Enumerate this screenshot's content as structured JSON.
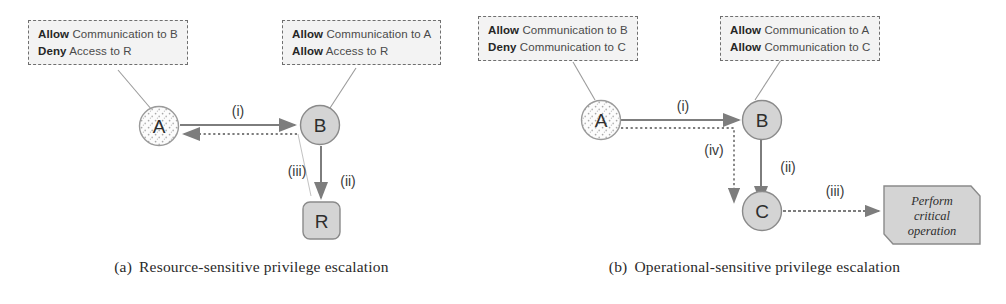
{
  "figure": {
    "panels": [
      {
        "id": "a",
        "caption_label": "(a)",
        "caption_text": "Resource-sensitive privilege escalation",
        "policy_boxes": [
          {
            "name": "policy-box-a-left",
            "lines": [
              {
                "keyword": "Allow",
                "rest": " Communication to B"
              },
              {
                "keyword": "Deny",
                "rest": " Access to R"
              }
            ]
          },
          {
            "name": "policy-box-a-right",
            "lines": [
              {
                "keyword": "Allow",
                "rest": " Communication to A"
              },
              {
                "keyword": "Allow",
                "rest": " Access to R"
              }
            ]
          }
        ],
        "nodes": [
          {
            "id": "A",
            "label": "A",
            "shape": "circle-dotted"
          },
          {
            "id": "B",
            "label": "B",
            "shape": "circle-solid"
          },
          {
            "id": "R",
            "label": "R",
            "shape": "rounded-square"
          }
        ],
        "edges": [
          {
            "id": "i",
            "label": "(i)",
            "from": "A",
            "to": "B",
            "style": "solid"
          },
          {
            "id": "ii",
            "label": "(ii)",
            "from": "B",
            "to": "R",
            "style": "solid"
          },
          {
            "id": "iii",
            "label": "(iii)",
            "from": "B",
            "to": "A",
            "style": "dotted"
          }
        ]
      },
      {
        "id": "b",
        "caption_label": "(b)",
        "caption_text": "Operational-sensitive privilege escalation",
        "policy_boxes": [
          {
            "name": "policy-box-b-left",
            "lines": [
              {
                "keyword": "Allow",
                "rest": " Communication to B"
              },
              {
                "keyword": "Deny",
                "rest": " Communication to C"
              }
            ]
          },
          {
            "name": "policy-box-b-right",
            "lines": [
              {
                "keyword": "Allow",
                "rest": " Communication to A"
              },
              {
                "keyword": "Allow",
                "rest": " Communication to C"
              }
            ]
          }
        ],
        "nodes": [
          {
            "id": "A",
            "label": "A",
            "shape": "circle-dotted"
          },
          {
            "id": "B",
            "label": "B",
            "shape": "circle-solid"
          },
          {
            "id": "C",
            "label": "C",
            "shape": "circle-solid"
          },
          {
            "id": "note",
            "label": "Perform critical operation",
            "shape": "note"
          }
        ],
        "note_lines": [
          "Perform",
          "critical",
          "operation"
        ],
        "edges": [
          {
            "id": "i",
            "label": "(i)",
            "from": "A",
            "to": "B",
            "style": "solid"
          },
          {
            "id": "ii",
            "label": "(ii)",
            "from": "B",
            "to": "C",
            "style": "solid"
          },
          {
            "id": "iii",
            "label": "(iii)",
            "from": "C",
            "to": "note",
            "style": "solid"
          },
          {
            "id": "iv",
            "label": "(iv)",
            "from": "A",
            "to": "C",
            "style": "dotted"
          }
        ]
      }
    ]
  },
  "colors": {
    "node_fill": "#d4d4d4",
    "node_stroke": "#8a8a8a",
    "node_dotted_fill": "#fbfbfb",
    "box_fill": "#f3f3f3",
    "box_stroke": "#6f6f6f",
    "edge": "#7d7d7d",
    "text": "#3a3a3a"
  }
}
